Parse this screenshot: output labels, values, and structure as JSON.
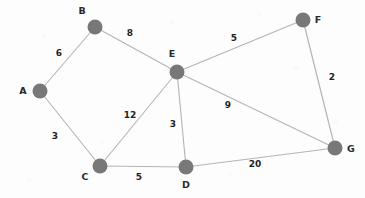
{
  "figure": {
    "kind": "undirected-weighted-graph",
    "width": 365,
    "height": 198,
    "background_color": "#fdfdfd",
    "node_color": "#787878",
    "edge_color": "#b4b4b4",
    "label_color": "#1f1f1f"
  },
  "nodes": [
    {
      "id": "A",
      "label": "A",
      "x": 40,
      "y": 91,
      "r": 7.5,
      "label_x": 23,
      "label_y": 94
    },
    {
      "id": "B",
      "label": "B",
      "x": 95,
      "y": 27,
      "r": 7.5,
      "label_x": 82,
      "label_y": 14
    },
    {
      "id": "C",
      "label": "C",
      "x": 100,
      "y": 166,
      "r": 7.5,
      "label_x": 85,
      "label_y": 180
    },
    {
      "id": "D",
      "label": "D",
      "x": 186,
      "y": 167,
      "r": 7.5,
      "label_x": 186,
      "label_y": 188
    },
    {
      "id": "E",
      "label": "E",
      "x": 177,
      "y": 72,
      "r": 7.5,
      "label_x": 172,
      "label_y": 57
    },
    {
      "id": "F",
      "label": "F",
      "x": 303,
      "y": 20,
      "r": 7.5,
      "label_x": 318,
      "label_y": 23
    },
    {
      "id": "G",
      "label": "G",
      "x": 335,
      "y": 148,
      "r": 7.5,
      "label_x": 351,
      "label_y": 152
    }
  ],
  "edges": [
    {
      "id": "A-B",
      "source": "A",
      "target": "B",
      "weight": "6",
      "label_x": 59,
      "label_y": 56
    },
    {
      "id": "B-E",
      "source": "B",
      "target": "E",
      "weight": "8",
      "label_x": 130,
      "label_y": 36
    },
    {
      "id": "A-C",
      "source": "A",
      "target": "C",
      "weight": "3",
      "label_x": 55,
      "label_y": 139
    },
    {
      "id": "C-E",
      "source": "C",
      "target": "E",
      "weight": "12",
      "label_x": 130,
      "label_y": 118
    },
    {
      "id": "C-D",
      "source": "C",
      "target": "D",
      "weight": "5",
      "label_x": 139,
      "label_y": 180
    },
    {
      "id": "E-D",
      "source": "E",
      "target": "D",
      "weight": "3",
      "label_x": 173,
      "label_y": 127
    },
    {
      "id": "E-F",
      "source": "E",
      "target": "F",
      "weight": "5",
      "label_x": 234,
      "label_y": 41
    },
    {
      "id": "E-G",
      "source": "E",
      "target": "G",
      "weight": "9",
      "label_x": 228,
      "label_y": 108
    },
    {
      "id": "F-G",
      "source": "F",
      "target": "G",
      "weight": "2",
      "label_x": 332,
      "label_y": 80
    },
    {
      "id": "D-G",
      "source": "D",
      "target": "G",
      "weight": "20",
      "label_x": 255,
      "label_y": 167
    }
  ],
  "chart_data": {
    "type": "diagram",
    "title": "",
    "graph_type": "undirected weighted graph",
    "node_count": 7,
    "edge_count": 10,
    "node_ids": [
      "A",
      "B",
      "C",
      "D",
      "E",
      "F",
      "G"
    ],
    "adjacency": [
      [
        "A",
        "B",
        6
      ],
      [
        "A",
        "C",
        3
      ],
      [
        "B",
        "E",
        8
      ],
      [
        "C",
        "E",
        12
      ],
      [
        "C",
        "D",
        5
      ],
      [
        "D",
        "E",
        3
      ],
      [
        "D",
        "G",
        20
      ],
      [
        "E",
        "F",
        5
      ],
      [
        "E",
        "G",
        9
      ],
      [
        "F",
        "G",
        2
      ]
    ],
    "weights": [
      6,
      3,
      8,
      12,
      5,
      3,
      20,
      5,
      9,
      2
    ],
    "node_degrees": {
      "A": 2,
      "B": 2,
      "C": 3,
      "D": 3,
      "E": 5,
      "F": 2,
      "G": 3
    }
  }
}
